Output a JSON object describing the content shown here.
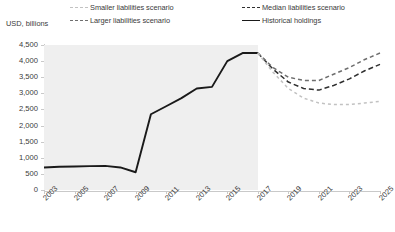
{
  "chart_data": {
    "type": "line",
    "title": "",
    "subtitle": "",
    "xlabel": "",
    "ylabel": "USD, billions",
    "ylim": [
      0,
      4500
    ],
    "ytick_step": 500,
    "yticks": [
      "0",
      "500",
      "1,000",
      "1,500",
      "2,000",
      "2,500",
      "3,000",
      "3,500",
      "4,000",
      "4,500"
    ],
    "xlim": [
      2003,
      2025
    ],
    "xticks": [
      "2003",
      "2005",
      "2007",
      "2009",
      "2011",
      "2013",
      "2015",
      "2017",
      "2019",
      "2021",
      "2023",
      "2025"
    ],
    "x_all_years": [
      2003,
      2004,
      2005,
      2006,
      2007,
      2008,
      2009,
      2010,
      2011,
      2012,
      2013,
      2014,
      2015,
      2016,
      2017,
      2018,
      2019,
      2020,
      2021,
      2022,
      2023,
      2024,
      2025
    ],
    "grid": false,
    "legend_position": "top",
    "shaded_region": {
      "label": "historical period",
      "x_start": 2003,
      "x_end": 2017,
      "color": "#efefef"
    },
    "series": [
      {
        "name": "Historical holdings",
        "style": "solid",
        "color": "#1a1a1a",
        "x": [
          2003,
          2004,
          2005,
          2006,
          2007,
          2008,
          2009,
          2010,
          2011,
          2012,
          2013,
          2014,
          2015,
          2016,
          2017
        ],
        "values": [
          700,
          720,
          730,
          740,
          750,
          700,
          550,
          2350,
          2600,
          2850,
          3150,
          3200,
          4000,
          4250,
          4250
        ]
      },
      {
        "name": "Median liabilities scenario",
        "style": "dashed",
        "color": "#2f2f2f",
        "x": [
          2017,
          2018,
          2019,
          2020,
          2021,
          2022,
          2023,
          2024,
          2025
        ],
        "values": [
          4250,
          3750,
          3350,
          3150,
          3100,
          3250,
          3450,
          3700,
          3900
        ]
      },
      {
        "name": "Larger liabilities scenario",
        "style": "dashed",
        "color": "#6e6e6e",
        "x": [
          2017,
          2018,
          2019,
          2020,
          2021,
          2022,
          2023,
          2024,
          2025
        ],
        "values": [
          4250,
          3800,
          3500,
          3400,
          3400,
          3600,
          3800,
          4050,
          4250
        ]
      },
      {
        "name": "Smaller liabilities scenario",
        "style": "dashed",
        "color": "#c2c2c2",
        "x": [
          2017,
          2018,
          2019,
          2020,
          2021,
          2022,
          2023,
          2024,
          2025
        ],
        "values": [
          4250,
          3650,
          3150,
          2850,
          2700,
          2650,
          2650,
          2700,
          2750
        ]
      }
    ]
  },
  "legend": {
    "smaller": "Smaller liabilities scenario",
    "larger": "Larger liabilities scenario",
    "median": "Median liabilities scenario",
    "historical": "Historical holdings"
  },
  "axis": {
    "y_title": "USD, billions"
  }
}
